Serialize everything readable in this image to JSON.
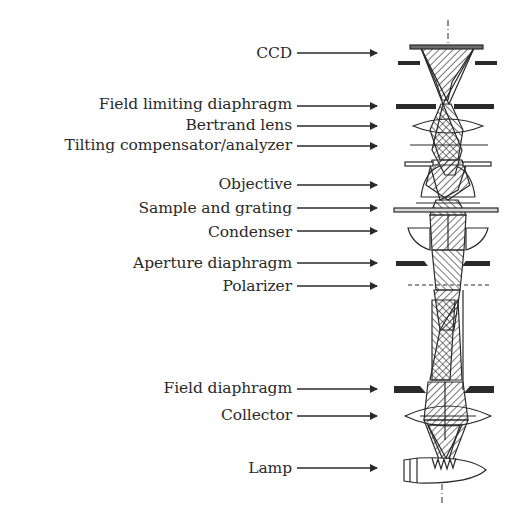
{
  "figure": {
    "type": "microscope optical path schematic",
    "labels": [
      {
        "id": "ccd",
        "text": "CCD",
        "y": 53
      },
      {
        "id": "field-limiting-diaphragm",
        "text": "Field limiting diaphragm",
        "y": 104
      },
      {
        "id": "bertrand-lens",
        "text": "Bertrand lens",
        "y": 125
      },
      {
        "id": "tilting-compensator-analyzer",
        "text": "Tilting compensator/analyzer",
        "y": 145
      },
      {
        "id": "objective",
        "text": "Objective",
        "y": 184
      },
      {
        "id": "sample-and-grating",
        "text": "Sample and grating",
        "y": 208
      },
      {
        "id": "condenser",
        "text": "Condenser",
        "y": 232
      },
      {
        "id": "aperture-diaphragm",
        "text": "Aperture diaphragm",
        "y": 263
      },
      {
        "id": "polarizer",
        "text": "Polarizer",
        "y": 286
      },
      {
        "id": "field-diaphragm",
        "text": "Field diaphragm",
        "y": 388
      },
      {
        "id": "collector",
        "text": "Collector",
        "y": 415
      },
      {
        "id": "lamp",
        "text": "Lamp",
        "y": 468
      }
    ],
    "colors": {
      "ink": "#2a2a2a",
      "background": "#ffffff"
    }
  }
}
